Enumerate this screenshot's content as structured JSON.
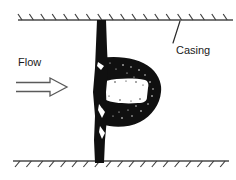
{
  "figure": {
    "width": 236,
    "height": 180,
    "background_color": "#ffffff"
  },
  "labels": {
    "flow": "Flow",
    "casing": "Casing"
  },
  "annotations": {
    "flow_label": {
      "text": "Flow",
      "x": 18,
      "y": 66,
      "font_size": 11
    },
    "casing_label": {
      "text": "Casing",
      "x": 176,
      "y": 54,
      "font_size": 11
    },
    "casing_leader": {
      "from_x": 180,
      "from_y": 21,
      "to_x": 173,
      "to_y": 43
    }
  },
  "flow_arrow": {
    "name": "flow-arrow",
    "style": "hollow-outline",
    "direction": "right",
    "shaft_left_x": 16,
    "shaft_right_x": 50,
    "tip_x": 67,
    "center_y": 87,
    "shaft_half_height": 4.5,
    "head_half_height": 9,
    "stroke_color": "#5a5a5a"
  },
  "casing_top": {
    "name": "casing-wall-top",
    "line_y": 20,
    "line_x1": 18,
    "line_x2": 233,
    "hatch_count": 19,
    "hatch_spacing": 11.4,
    "hatch_start_x": 22,
    "hatch_dx": -4,
    "hatch_dy": -6,
    "color": "#4a4a4a"
  },
  "casing_bottom": {
    "name": "casing-wall-bottom",
    "line_y": 161,
    "line_x1": 13,
    "line_x2": 229,
    "hatch_count": 19,
    "hatch_spacing": 11.4,
    "hatch_start_x": 20,
    "hatch_dx": -5,
    "hatch_dy": 6,
    "color": "#4a4a4a"
  },
  "valve_plate": {
    "name": "valve-plate",
    "description": "vertical dark plate spanning casing",
    "top_y": 20,
    "bottom_y": 163,
    "x_left": 93,
    "x_right": 108,
    "color": "#101010"
  },
  "bulb_mass": {
    "name": "bulb-mass",
    "description": "dark bulbous elliptical body attached right of plate",
    "left_x": 100,
    "right_x": 161,
    "top_y": 57,
    "bottom_y": 126,
    "center_y": 91,
    "color": "#101010"
  },
  "cavity": {
    "name": "cavity-void",
    "description": "white cavity band through bulb",
    "left_x": 104,
    "right_x": 148,
    "top_y": 80,
    "bottom_y": 103,
    "color": "#ffffff"
  },
  "colors": {
    "ink": "#101010",
    "line": "#4a4a4a",
    "text": "#1a1a1a",
    "arrow": "#5a5a5a",
    "background": "#ffffff"
  }
}
